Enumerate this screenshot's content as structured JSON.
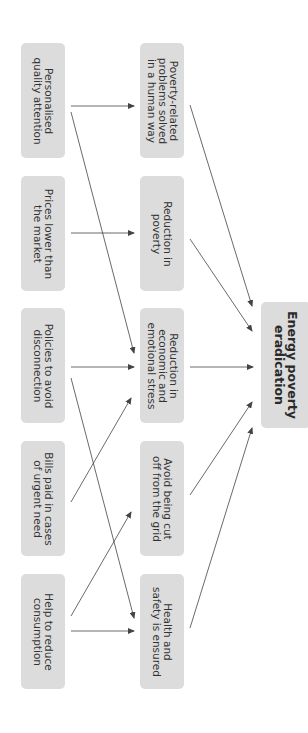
{
  "diagram": {
    "orientation": "rotated 90 degrees clockwise",
    "colors": {
      "node_fill": "#dcdcdc",
      "text": "#333333",
      "arrow": "#444444",
      "background": "#ffffff"
    },
    "nodes": {
      "personalised_attention": {
        "label": "Personalised\nquality attention",
        "column": "cause"
      },
      "prices_lower": {
        "label": "Prices lower than\nthe market",
        "column": "cause"
      },
      "policies_disconnection": {
        "label": "Policies to avoid\ndisconnection",
        "column": "cause"
      },
      "bills_paid": {
        "label": "Bills paid in cases\nof urgent need",
        "column": "cause"
      },
      "help_reduce": {
        "label": "Help to reduce\nconsumption",
        "column": "cause"
      },
      "poverty_problems_solved": {
        "label": "Poverty-related\nproblems solved\nin a human way",
        "column": "effect"
      },
      "reduction_poverty": {
        "label": "Reduction in\npoverty",
        "column": "effect"
      },
      "reduction_stress": {
        "label": "Reduction in\neconomic and\nemotional stress",
        "column": "effect"
      },
      "avoid_cut_off": {
        "label": "Avoid being cut\noff from the grid",
        "column": "effect"
      },
      "health_safety": {
        "label": "Health and\nsafety is ensured",
        "column": "effect"
      },
      "energy_poverty_eradication": {
        "label": "Energy poverty\neradication",
        "column": "outcome"
      }
    },
    "edges": [
      {
        "from": "Personalised quality attention",
        "to": "Poverty-related problems solved in a human way"
      },
      {
        "from": "Personalised quality attention",
        "to": "Reduction in economic and emotional stress"
      },
      {
        "from": "Prices lower than the market",
        "to": "Reduction in poverty"
      },
      {
        "from": "Policies to avoid disconnection",
        "to": "Reduction in economic and emotional stress"
      },
      {
        "from": "Policies to avoid disconnection",
        "to": "Health and safety is ensured"
      },
      {
        "from": "Bills paid in cases of urgent need",
        "to": "Reduction in economic and emotional stress"
      },
      {
        "from": "Help to reduce consumption",
        "to": "Avoid being cut off from the grid"
      },
      {
        "from": "Help to reduce consumption",
        "to": "Health and safety is ensured"
      },
      {
        "from": "Poverty-related problems solved in a human way",
        "to": "Energy poverty eradication"
      },
      {
        "from": "Reduction in poverty",
        "to": "Energy poverty eradication"
      },
      {
        "from": "Reduction in economic and emotional stress",
        "to": "Energy poverty eradication"
      },
      {
        "from": "Avoid being cut off from the grid",
        "to": "Energy poverty eradication"
      },
      {
        "from": "Health and safety is ensured",
        "to": "Energy poverty eradication"
      }
    ]
  }
}
